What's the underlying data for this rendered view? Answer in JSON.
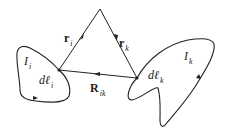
{
  "diagram": {
    "type": "vector-geometry",
    "colors": {
      "stroke": "#222222",
      "background": "#ffffff"
    },
    "labels": {
      "r_i": {
        "main": "r",
        "sub": "i"
      },
      "r_k": {
        "main": "r",
        "sub": "k"
      },
      "R_ik": {
        "main": "R",
        "sub": "ik"
      },
      "I_i": {
        "main": "I",
        "sub": "i"
      },
      "I_k": {
        "main": "I",
        "sub": "k"
      },
      "dl_i": {
        "main": "dℓ",
        "sub": "i"
      },
      "dl_k": {
        "main": "dℓ",
        "sub": "k"
      }
    },
    "nodes": {
      "origin": [
        100,
        9
      ],
      "left_junction": [
        59,
        70
      ],
      "right_junction": [
        137,
        78
      ]
    }
  }
}
